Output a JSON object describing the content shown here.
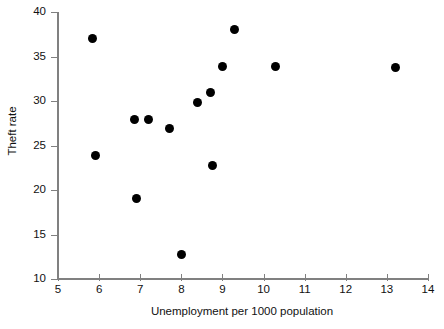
{
  "chart_data": {
    "type": "scatter",
    "title": "",
    "xlabel": "Unemployment per 1000 population",
    "ylabel": "Theft rate",
    "xlim": [
      5,
      14
    ],
    "ylim": [
      10,
      40
    ],
    "xticks": [
      5,
      6,
      7,
      8,
      9,
      10,
      11,
      12,
      13,
      14
    ],
    "yticks": [
      10,
      15,
      20,
      25,
      30,
      35,
      40
    ],
    "grid": false,
    "legend": null,
    "marker": {
      "shape": "circle",
      "color": "#000000",
      "size": 9
    },
    "axis_color": "#808080",
    "background": "#ffffff",
    "points": [
      {
        "x": 5.85,
        "y": 37.0
      },
      {
        "x": 5.9,
        "y": 23.9
      },
      {
        "x": 6.85,
        "y": 27.9
      },
      {
        "x": 6.9,
        "y": 19.0
      },
      {
        "x": 7.2,
        "y": 27.9
      },
      {
        "x": 7.7,
        "y": 26.9
      },
      {
        "x": 8.0,
        "y": 12.8
      },
      {
        "x": 8.4,
        "y": 29.8
      },
      {
        "x": 8.7,
        "y": 30.9
      },
      {
        "x": 8.75,
        "y": 22.8
      },
      {
        "x": 9.0,
        "y": 33.9
      },
      {
        "x": 9.3,
        "y": 38.0
      },
      {
        "x": 10.3,
        "y": 33.9
      },
      {
        "x": 13.2,
        "y": 33.8
      }
    ]
  }
}
